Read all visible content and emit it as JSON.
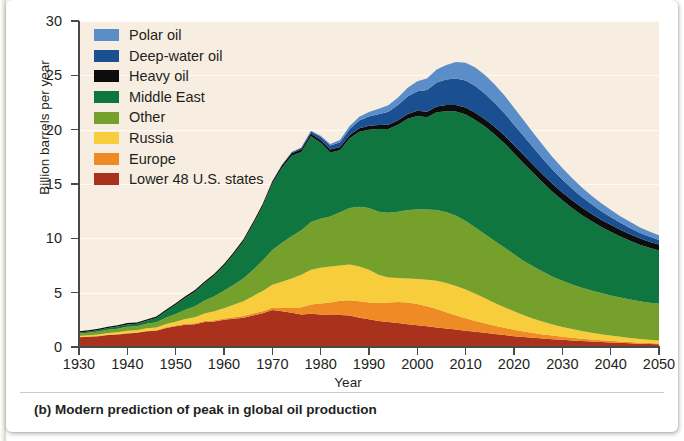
{
  "caption": "(b) Modern prediction of peak in global oil production",
  "axes": {
    "y_title": "Billion barrels per year",
    "x_title": "Year",
    "y_ticks": [
      "0",
      "5",
      "10",
      "15",
      "20",
      "25",
      "30"
    ],
    "x_ticks": [
      "1930",
      "1940",
      "1950",
      "1960",
      "1970",
      "1980",
      "1990",
      "2000",
      "2010",
      "2020",
      "2030",
      "2040",
      "2050"
    ]
  },
  "legend": {
    "items": [
      {
        "label": "Polar oil",
        "color": "#5b8ec9"
      },
      {
        "label": "Deep-water oil",
        "color": "#1a4f92"
      },
      {
        "label": "Heavy oil",
        "color": "#0d0d0d"
      },
      {
        "label": "Middle East",
        "color": "#10763f"
      },
      {
        "label": "Other",
        "color": "#76a02c"
      },
      {
        "label": "Russia",
        "color": "#f7cd3b"
      },
      {
        "label": "Europe",
        "color": "#ef8b25"
      },
      {
        "label": "Lower 48 U.S. states",
        "color": "#a8321b"
      }
    ]
  },
  "plot": {
    "background_color": "#f7eee1",
    "gridline_color": "#ffffff",
    "axis_color": "#4a4a48"
  },
  "chart_data": {
    "type": "area",
    "stacked": true,
    "title": "(b) Modern prediction of peak in global oil production",
    "xlabel": "Year",
    "ylabel": "Billion barrels per year",
    "xlim": [
      1930,
      2050
    ],
    "ylim": [
      0,
      30
    ],
    "yticks": [
      0,
      5,
      10,
      15,
      20,
      25,
      30
    ],
    "xticks": [
      1930,
      1940,
      1950,
      1960,
      1970,
      1980,
      1990,
      2000,
      2010,
      2020,
      2030,
      2040,
      2050
    ],
    "grid": "horizontal",
    "legend_position": "upper-left-inside",
    "stack_order_bottom_to_top": [
      "Lower 48 U.S. states",
      "Europe",
      "Russia",
      "Other",
      "Middle East",
      "Heavy oil",
      "Deep-water oil",
      "Polar oil"
    ],
    "x": [
      1930,
      1932,
      1934,
      1936,
      1938,
      1940,
      1942,
      1944,
      1946,
      1948,
      1950,
      1952,
      1954,
      1956,
      1958,
      1960,
      1962,
      1964,
      1966,
      1968,
      1970,
      1972,
      1974,
      1976,
      1978,
      1980,
      1982,
      1984,
      1986,
      1988,
      1990,
      1992,
      1994,
      1996,
      1998,
      2000,
      2002,
      2004,
      2006,
      2008,
      2010,
      2012,
      2014,
      2016,
      2018,
      2020,
      2022,
      2024,
      2026,
      2028,
      2030,
      2032,
      2034,
      2036,
      2038,
      2040,
      2042,
      2044,
      2046,
      2048,
      2050
    ],
    "series": [
      {
        "name": "Lower 48 U.S. states",
        "color": "#a8321b",
        "values": [
          0.9,
          0.95,
          1.0,
          1.1,
          1.15,
          1.25,
          1.3,
          1.45,
          1.5,
          1.75,
          1.9,
          2.05,
          2.1,
          2.3,
          2.35,
          2.5,
          2.6,
          2.7,
          2.9,
          3.1,
          3.4,
          3.3,
          3.15,
          3.0,
          3.05,
          3.0,
          2.95,
          2.95,
          2.9,
          2.7,
          2.55,
          2.4,
          2.3,
          2.2,
          2.1,
          2.0,
          1.9,
          1.8,
          1.7,
          1.6,
          1.5,
          1.4,
          1.3,
          1.2,
          1.1,
          1.0,
          0.92,
          0.85,
          0.78,
          0.72,
          0.66,
          0.6,
          0.55,
          0.5,
          0.46,
          0.42,
          0.38,
          0.34,
          0.3,
          0.27,
          0.25
        ]
      },
      {
        "name": "Europe",
        "color": "#ef8b25",
        "values": [
          0.02,
          0.02,
          0.03,
          0.03,
          0.04,
          0.04,
          0.04,
          0.05,
          0.05,
          0.06,
          0.07,
          0.08,
          0.09,
          0.1,
          0.11,
          0.12,
          0.14,
          0.16,
          0.18,
          0.2,
          0.22,
          0.3,
          0.45,
          0.65,
          0.85,
          1.0,
          1.15,
          1.3,
          1.4,
          1.5,
          1.55,
          1.65,
          1.8,
          1.95,
          2.0,
          1.95,
          1.85,
          1.7,
          1.5,
          1.3,
          1.15,
          1.0,
          0.88,
          0.76,
          0.66,
          0.58,
          0.5,
          0.44,
          0.38,
          0.33,
          0.29,
          0.25,
          0.22,
          0.19,
          0.17,
          0.15,
          0.13,
          0.11,
          0.1,
          0.09,
          0.08
        ]
      },
      {
        "name": "Russia",
        "color": "#f7cd3b",
        "values": [
          0.1,
          0.11,
          0.13,
          0.15,
          0.17,
          0.2,
          0.2,
          0.22,
          0.25,
          0.3,
          0.36,
          0.45,
          0.55,
          0.68,
          0.82,
          0.95,
          1.15,
          1.35,
          1.6,
          1.85,
          2.1,
          2.4,
          2.7,
          3.0,
          3.2,
          3.3,
          3.3,
          3.25,
          3.3,
          3.2,
          3.0,
          2.6,
          2.3,
          2.2,
          2.2,
          2.3,
          2.45,
          2.6,
          2.7,
          2.72,
          2.65,
          2.5,
          2.3,
          2.1,
          1.9,
          1.7,
          1.5,
          1.32,
          1.16,
          1.02,
          0.9,
          0.8,
          0.7,
          0.62,
          0.55,
          0.48,
          0.43,
          0.38,
          0.34,
          0.3,
          0.27
        ]
      },
      {
        "name": "Other",
        "color": "#76a02c",
        "values": [
          0.22,
          0.24,
          0.27,
          0.3,
          0.33,
          0.37,
          0.38,
          0.42,
          0.48,
          0.58,
          0.7,
          0.85,
          1.0,
          1.2,
          1.4,
          1.6,
          1.85,
          2.1,
          2.4,
          2.8,
          3.2,
          3.6,
          3.9,
          4.1,
          4.4,
          4.5,
          4.6,
          4.9,
          5.2,
          5.5,
          5.7,
          5.8,
          5.95,
          6.1,
          6.3,
          6.4,
          6.45,
          6.5,
          6.5,
          6.45,
          6.3,
          6.1,
          5.9,
          5.7,
          5.5,
          5.25,
          5.0,
          4.8,
          4.6,
          4.4,
          4.25,
          4.1,
          3.98,
          3.88,
          3.78,
          3.7,
          3.62,
          3.55,
          3.48,
          3.42,
          3.38
        ]
      },
      {
        "name": "Middle East",
        "color": "#10763f",
        "values": [
          0.08,
          0.1,
          0.13,
          0.16,
          0.2,
          0.22,
          0.22,
          0.28,
          0.4,
          0.6,
          0.85,
          1.1,
          1.35,
          1.6,
          1.9,
          2.3,
          2.8,
          3.4,
          4.2,
          5.0,
          6.1,
          6.9,
          7.4,
          7.2,
          7.9,
          7.0,
          5.9,
          5.7,
          6.4,
          6.9,
          7.2,
          7.6,
          7.7,
          8.0,
          8.4,
          8.6,
          8.5,
          9.0,
          9.3,
          9.6,
          9.8,
          9.9,
          9.9,
          9.8,
          9.6,
          9.3,
          9.0,
          8.6,
          8.2,
          7.8,
          7.4,
          7.05,
          6.7,
          6.4,
          6.1,
          5.85,
          5.6,
          5.4,
          5.2,
          5.05,
          4.9
        ]
      },
      {
        "name": "Heavy oil",
        "color": "#0d0d0d",
        "values": [
          0.12,
          0.12,
          0.12,
          0.12,
          0.12,
          0.12,
          0.12,
          0.12,
          0.13,
          0.13,
          0.14,
          0.14,
          0.15,
          0.15,
          0.16,
          0.16,
          0.17,
          0.18,
          0.19,
          0.2,
          0.21,
          0.22,
          0.23,
          0.24,
          0.25,
          0.26,
          0.28,
          0.3,
          0.32,
          0.34,
          0.36,
          0.38,
          0.4,
          0.42,
          0.45,
          0.48,
          0.5,
          0.53,
          0.56,
          0.6,
          0.63,
          0.66,
          0.68,
          0.7,
          0.72,
          0.73,
          0.74,
          0.74,
          0.74,
          0.73,
          0.72,
          0.71,
          0.7,
          0.68,
          0.66,
          0.64,
          0.62,
          0.6,
          0.58,
          0.56,
          0.55
        ]
      },
      {
        "name": "Deep-water oil",
        "color": "#1a4f92",
        "values": [
          0.0,
          0.0,
          0.0,
          0.0,
          0.0,
          0.0,
          0.0,
          0.0,
          0.0,
          0.0,
          0.0,
          0.0,
          0.0,
          0.0,
          0.0,
          0.0,
          0.0,
          0.0,
          0.0,
          0.02,
          0.04,
          0.06,
          0.1,
          0.14,
          0.2,
          0.28,
          0.36,
          0.45,
          0.55,
          0.7,
          0.85,
          1.0,
          1.2,
          1.4,
          1.6,
          1.8,
          2.0,
          2.2,
          2.35,
          2.45,
          2.5,
          2.45,
          2.35,
          2.2,
          2.05,
          1.9,
          1.75,
          1.6,
          1.45,
          1.32,
          1.2,
          1.08,
          0.98,
          0.88,
          0.8,
          0.72,
          0.65,
          0.58,
          0.52,
          0.47,
          0.42
        ]
      },
      {
        "name": "Polar oil",
        "color": "#5b8ec9",
        "values": [
          0.0,
          0.0,
          0.0,
          0.0,
          0.0,
          0.0,
          0.0,
          0.0,
          0.0,
          0.0,
          0.0,
          0.0,
          0.0,
          0.0,
          0.0,
          0.0,
          0.0,
          0.0,
          0.0,
          0.0,
          0.0,
          0.0,
          0.02,
          0.04,
          0.06,
          0.1,
          0.14,
          0.2,
          0.26,
          0.34,
          0.42,
          0.5,
          0.6,
          0.7,
          0.8,
          0.92,
          1.05,
          1.2,
          1.35,
          1.5,
          1.62,
          1.7,
          1.72,
          1.7,
          1.64,
          1.55,
          1.45,
          1.35,
          1.25,
          1.15,
          1.05,
          0.96,
          0.88,
          0.8,
          0.73,
          0.67,
          0.61,
          0.56,
          0.51,
          0.47,
          0.43
        ]
      }
    ],
    "annotations": [
      {
        "text": "peak around 2007 at roughly 27 billion barrels per year"
      }
    ]
  }
}
